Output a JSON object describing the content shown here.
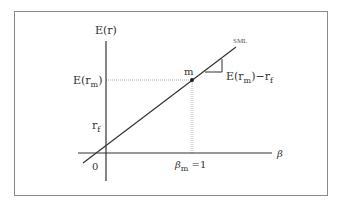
{
  "diagram": {
    "y_axis_label": "E(r)",
    "x_axis_label": "β",
    "line_label": "SML",
    "origin_label": "0",
    "rf_label": {
      "main": "r",
      "sub": "f"
    },
    "erm_label": {
      "main": "E(r",
      "sub": "m",
      "close": ")"
    },
    "market_point_label": "m",
    "beta_m_label": {
      "main": "β",
      "sub": "m",
      "rest": " =1"
    },
    "risk_premium_label": {
      "main": "E(r",
      "sub": "m",
      "mid": ")−r",
      "sub2": "f"
    },
    "colors": {
      "border": "#8a8a8a",
      "axis": "#333333",
      "line": "#333333",
      "dotted": "#aaaaaa",
      "text": "#333333"
    }
  }
}
